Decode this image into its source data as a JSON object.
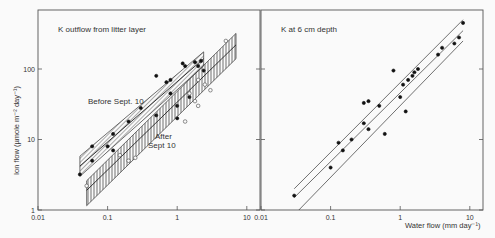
{
  "chart_data": [
    {
      "type": "scatter",
      "panel": "left",
      "title": "K outflow from litter layer",
      "xlabel": "",
      "ylabel": "Ion flow (µmole m⁻² day⁻¹)",
      "xscale": "log",
      "yscale": "log",
      "xlim": [
        0.01,
        10
      ],
      "ylim": [
        1,
        400
      ],
      "x_ticks": [
        "0.01",
        "0.1",
        "1",
        "10"
      ],
      "y_ticks": [
        "1",
        "10",
        "100"
      ],
      "grid": false,
      "annotations": [
        "Before Sept. 10",
        "After Sept 10"
      ],
      "series": [
        {
          "name": "Before Sept. 10",
          "marker": "filled-circle",
          "points": [
            [
              0.04,
              3.2
            ],
            [
              0.06,
              5
            ],
            [
              0.06,
              8
            ],
            [
              0.1,
              8
            ],
            [
              0.12,
              7
            ],
            [
              0.12,
              12
            ],
            [
              0.2,
              18
            ],
            [
              0.3,
              28
            ],
            [
              0.5,
              22
            ],
            [
              0.5,
              80
            ],
            [
              0.7,
              65
            ],
            [
              0.8,
              45
            ],
            [
              0.8,
              70
            ],
            [
              1.0,
              30
            ],
            [
              1.0,
              20
            ],
            [
              1.2,
              120
            ],
            [
              1.3,
              110
            ],
            [
              1.5,
              40
            ],
            [
              1.8,
              125
            ],
            [
              2.0,
              110
            ],
            [
              2.2,
              130
            ],
            [
              2.4,
              95
            ]
          ],
          "fit_band": {
            "x": [
              0.04,
              2.4
            ],
            "y_center": [
              4.2,
              140
            ],
            "y_upper": [
              5.8,
              175
            ],
            "y_lower": [
              3.0,
              110
            ],
            "hatch": "diagonal"
          }
        },
        {
          "name": "After Sept 10",
          "marker": "open-circle",
          "points": [
            [
              0.05,
              2.2
            ],
            [
              0.15,
              6
            ],
            [
              0.2,
              5
            ],
            [
              0.25,
              5.5
            ],
            [
              1.3,
              18
            ],
            [
              1.5,
              45
            ],
            [
              1.8,
              35
            ],
            [
              2.0,
              30
            ],
            [
              2.0,
              70
            ],
            [
              2.5,
              60
            ],
            [
              3.0,
              50
            ],
            [
              5.0,
              250
            ]
          ],
          "fit_band": {
            "x": [
              0.05,
              7
            ],
            "y_center": [
              1.9,
              220
            ],
            "y_upper": [
              2.6,
              320
            ],
            "y_lower": [
              1.15,
              140
            ],
            "hatch": "vertical"
          }
        }
      ]
    },
    {
      "type": "scatter",
      "panel": "right",
      "title": "K at 6 cm depth",
      "xlabel": "Water flow (mm day⁻¹)",
      "ylabel": "",
      "xscale": "log",
      "yscale": "log",
      "xlim": [
        0.01,
        10
      ],
      "ylim": [
        1,
        400
      ],
      "x_ticks": [
        "0.01",
        "0.1",
        "1",
        "10"
      ],
      "grid": false,
      "series": [
        {
          "name": "K at 6 cm depth",
          "marker": "filled-circle",
          "points": [
            [
              0.03,
              1.6
            ],
            [
              0.1,
              4
            ],
            [
              0.13,
              9
            ],
            [
              0.15,
              7
            ],
            [
              0.2,
              10
            ],
            [
              0.3,
              17
            ],
            [
              0.3,
              33
            ],
            [
              0.35,
              35
            ],
            [
              0.35,
              14
            ],
            [
              0.5,
              30
            ],
            [
              0.6,
              12
            ],
            [
              0.8,
              95
            ],
            [
              1.0,
              40
            ],
            [
              1.1,
              60
            ],
            [
              1.2,
              25
            ],
            [
              1.3,
              70
            ],
            [
              1.5,
              80
            ],
            [
              1.6,
              90
            ],
            [
              1.8,
              100
            ],
            [
              3.5,
              160
            ],
            [
              4.0,
              200
            ],
            [
              6.0,
              230
            ],
            [
              7.0,
              280
            ],
            [
              8.0,
              450
            ]
          ],
          "fit_lines": [
            {
              "name": "upper",
              "x": [
                0.03,
                8
              ],
              "y": [
                2.0,
                500
              ]
            },
            {
              "name": "regression",
              "x": [
                0.03,
                8
              ],
              "y": [
                1.5,
                350
              ]
            },
            {
              "name": "lower",
              "x": [
                0.035,
                8
              ],
              "y": [
                1.0,
                250
              ]
            }
          ]
        }
      ]
    }
  ],
  "labels": {
    "left_title": "K outflow from litter layer",
    "right_title": "K at 6 cm depth",
    "before": "Before Sept. 10",
    "after_1": "After",
    "after_2": "Sept 10",
    "ylabel": "Ion flow (µmole m⁻² day⁻¹)",
    "xlabel": "Water flow (mm day⁻¹)",
    "xticks_left": [
      "0.01",
      "0.1",
      "1",
      "10"
    ],
    "xticks_right": [
      "0.01",
      "0.1",
      "1",
      "10"
    ],
    "yticks": [
      "1",
      "10",
      "100"
    ]
  }
}
